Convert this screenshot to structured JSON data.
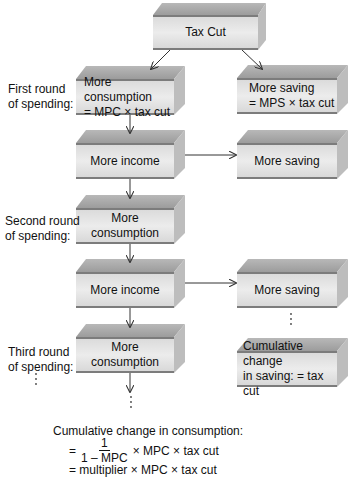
{
  "colors": {
    "box_front": "#e6e6e6",
    "box_top": "#a9a9a9",
    "box_side": "#bdbdbd",
    "box_band": "#7c7c7c",
    "arrow": "#333333"
  },
  "boxes": {
    "tax_cut": {
      "label": "Tax Cut"
    },
    "first_consumption": {
      "line1": "More consumption",
      "line2": "= MPC × tax cut"
    },
    "first_saving": {
      "line1": "More saving",
      "line2": "= MPS × tax cut"
    },
    "income_1": {
      "label": "More income"
    },
    "saving_1": {
      "label": "More saving"
    },
    "second_consumption": {
      "label": "More consumption"
    },
    "income_2": {
      "label": "More income"
    },
    "saving_2": {
      "label": "More saving"
    },
    "third_consumption": {
      "label": "More consumption"
    },
    "cumulative_saving": {
      "line1": "Cumulative change",
      "line2": "in saving: = tax cut"
    }
  },
  "side_labels": {
    "first_round": {
      "line1": "First round",
      "line2": "of spending:"
    },
    "second_round": {
      "line1": "Second round",
      "line2": "of spending:"
    },
    "third_round": {
      "line1": "Third round",
      "line2": "of spending:"
    }
  },
  "ellipsis": "⋮",
  "formula": {
    "heading": "Cumulative change in consumption:",
    "line1_prefix": "=",
    "frac_num": "1",
    "frac_den": "1 – MPC",
    "line1_suffix": "× MPC × tax cut",
    "line2": "= multiplier × MPC × tax cut"
  }
}
